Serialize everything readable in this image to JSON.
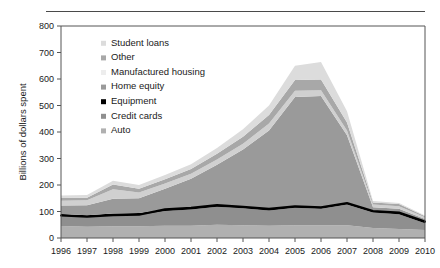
{
  "chart_data": {
    "type": "area",
    "stacked": true,
    "title": "",
    "xlabel": "",
    "ylabel": "Billions of dollars spent",
    "categories": [
      1996,
      1997,
      1998,
      1999,
      2000,
      2001,
      2002,
      2003,
      2004,
      2005,
      2006,
      2007,
      2008,
      2009,
      2010
    ],
    "x_tick_labels": [
      "1996",
      "1997",
      "1998",
      "1999",
      "2000",
      "2001",
      "2002",
      "2003",
      "2004",
      "2005",
      "2006",
      "2007",
      "2008",
      "2009",
      "2010"
    ],
    "y_tick_labels": [
      "0",
      "100",
      "200",
      "300",
      "400",
      "500",
      "600",
      "700",
      "800"
    ],
    "y_ticks": [
      0,
      100,
      200,
      300,
      400,
      500,
      600,
      700,
      800
    ],
    "ylim": [
      0,
      800
    ],
    "xlim": [
      1996,
      2010
    ],
    "grid": false,
    "legend_position": "upper-left-inside",
    "series": [
      {
        "name": "Auto",
        "color": "#b0b0b0",
        "values": [
          45,
          42,
          44,
          44,
          46,
          46,
          50,
          48,
          46,
          48,
          48,
          48,
          38,
          34,
          30
        ]
      },
      {
        "name": "Credit cards",
        "color": "#8f8f8f",
        "values": [
          40,
          38,
          42,
          44,
          56,
          62,
          68,
          64,
          58,
          66,
          62,
          78,
          58,
          56,
          26
        ]
      },
      {
        "name": "Equipment",
        "color": "#000000",
        "values": [
          6,
          6,
          6,
          6,
          6,
          6,
          6,
          6,
          6,
          6,
          6,
          6,
          6,
          6,
          6
        ]
      },
      {
        "name": "Home equity",
        "color": "#9a9a9a",
        "values": [
          32,
          38,
          56,
          56,
          78,
          110,
          152,
          216,
          296,
          412,
          420,
          256,
          14,
          14,
          10
        ]
      },
      {
        "name": "Manufactured housing",
        "color": "#d0d0d0",
        "values": [
          18,
          18,
          36,
          22,
          20,
          18,
          20,
          22,
          26,
          24,
          22,
          18,
          10,
          10,
          6
        ]
      },
      {
        "name": "Other",
        "color": "#a8a8a8",
        "values": [
          10,
          10,
          18,
          14,
          16,
          18,
          22,
          26,
          32,
          40,
          40,
          30,
          8,
          8,
          4
        ]
      },
      {
        "name": "Student loans",
        "color": "#dcdcdc",
        "values": [
          9,
          10,
          14,
          14,
          16,
          18,
          22,
          28,
          36,
          54,
          66,
          42,
          6,
          4,
          3
        ]
      }
    ],
    "totals": [
      160,
      162,
      216,
      200,
      238,
      278,
      340,
      410,
      500,
      650,
      664,
      478,
      140,
      132,
      85
    ],
    "equipment_line": {
      "name": "Equipment",
      "color": "#000000",
      "values": [
        85,
        80,
        86,
        88,
        108,
        114,
        124,
        118,
        110,
        120,
        116,
        132,
        102,
        96,
        62
      ]
    },
    "legend_entries": [
      {
        "label": "Student loans",
        "swatch": "#dcdcdc"
      },
      {
        "label": "Other",
        "swatch": "#a8a8a8"
      },
      {
        "label": "Manufactured housing",
        "swatch": "#ededed"
      },
      {
        "label": "Home equity",
        "swatch": "#9a9a9a"
      },
      {
        "label": "Equipment",
        "swatch": "#000000"
      },
      {
        "label": "Credit cards",
        "swatch": "#8f8f8f"
      },
      {
        "label": "Auto",
        "swatch": "#b0b0b0"
      }
    ],
    "axis_color": "#555555"
  }
}
